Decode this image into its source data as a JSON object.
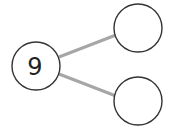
{
  "diagram": {
    "type": "number-bond",
    "colors": {
      "background": "#ffffff",
      "circle_stroke": "#333333",
      "circle_fill": "#ffffff",
      "connector": "#a6a6a6",
      "text": "#222222"
    },
    "whole": {
      "label": "9",
      "cx": 36,
      "cy": 66,
      "r": 24
    },
    "parts": [
      {
        "label": "",
        "cx": 138,
        "cy": 28,
        "r": 24
      },
      {
        "label": "",
        "cx": 138,
        "cy": 101,
        "r": 24
      }
    ],
    "connectors": [
      {
        "x1": 59,
        "y1": 57,
        "x2": 116,
        "y2": 35
      },
      {
        "x1": 59,
        "y1": 74,
        "x2": 116,
        "y2": 96
      }
    ]
  }
}
